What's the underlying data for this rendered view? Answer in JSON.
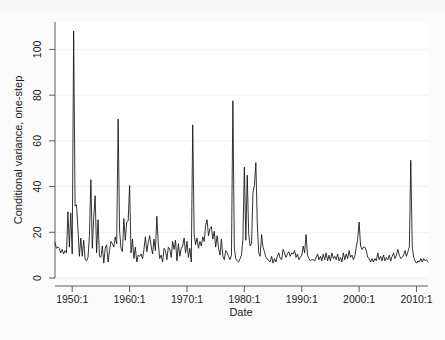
{
  "figure": {
    "background_color": "#fbfbfb",
    "plot_background_color": "#ffffff",
    "line_color": "#111111",
    "axis_color": "#4a4a4a",
    "grid_color": "#e8e8e8"
  },
  "chart_data": {
    "type": "line",
    "title": "",
    "subtitle": "",
    "xlabel": "Date",
    "ylabel": "Conditional variance, one-step",
    "xlim": [
      1947.0,
      2012.0
    ],
    "ylim": [
      0,
      112
    ],
    "yticks": [
      0,
      20,
      40,
      60,
      80,
      100
    ],
    "ytick_labels": [
      "0",
      "20",
      "40",
      "60",
      "80",
      "100"
    ],
    "xticks": [
      1950,
      1960,
      1970,
      1980,
      1990,
      2000,
      2010
    ],
    "xtick_labels": [
      "1950:1",
      "1960:1",
      "1970:1",
      "1980:1",
      "1990:1",
      "2000:1",
      "2010:1"
    ],
    "grid": true,
    "grid_axis": "y",
    "legend": false,
    "legend_position": "none",
    "series": [
      {
        "name": "Conditional variance, one-step",
        "color": "#111111",
        "x": [
          1947.0,
          1947.25,
          1947.5,
          1947.75,
          1948.0,
          1948.25,
          1948.5,
          1948.75,
          1949.0,
          1949.25,
          1949.5,
          1949.75,
          1950.0,
          1950.25,
          1950.5,
          1950.75,
          1951.0,
          1951.25,
          1951.5,
          1951.75,
          1952.0,
          1952.25,
          1952.5,
          1952.75,
          1953.0,
          1953.25,
          1953.5,
          1953.75,
          1954.0,
          1954.25,
          1954.5,
          1954.75,
          1955.0,
          1955.25,
          1955.5,
          1955.75,
          1956.0,
          1956.25,
          1956.5,
          1956.75,
          1957.0,
          1957.25,
          1957.5,
          1957.75,
          1958.0,
          1958.25,
          1958.5,
          1958.75,
          1959.0,
          1959.25,
          1959.5,
          1959.75,
          1960.0,
          1960.25,
          1960.5,
          1960.75,
          1961.0,
          1961.25,
          1961.5,
          1961.75,
          1962.0,
          1962.25,
          1962.5,
          1962.75,
          1963.0,
          1963.25,
          1963.5,
          1963.75,
          1964.0,
          1964.25,
          1964.5,
          1964.75,
          1965.0,
          1965.25,
          1965.5,
          1965.75,
          1966.0,
          1966.25,
          1966.5,
          1966.75,
          1967.0,
          1967.25,
          1967.5,
          1967.75,
          1968.0,
          1968.25,
          1968.5,
          1968.75,
          1969.0,
          1969.25,
          1969.5,
          1969.75,
          1970.0,
          1970.25,
          1970.5,
          1970.75,
          1971.0,
          1971.25,
          1971.5,
          1971.75,
          1972.0,
          1972.25,
          1972.5,
          1972.75,
          1973.0,
          1973.25,
          1973.5,
          1973.75,
          1974.0,
          1974.25,
          1974.5,
          1974.75,
          1975.0,
          1975.25,
          1975.5,
          1975.75,
          1976.0,
          1976.25,
          1976.5,
          1976.75,
          1977.0,
          1977.25,
          1977.5,
          1977.75,
          1978.0,
          1978.25,
          1978.5,
          1978.75,
          1979.0,
          1979.25,
          1979.5,
          1979.75,
          1980.0,
          1980.25,
          1980.5,
          1980.75,
          1981.0,
          1981.25,
          1981.5,
          1981.75,
          1982.0,
          1982.25,
          1982.5,
          1982.75,
          1983.0,
          1983.25,
          1983.5,
          1983.75,
          1984.0,
          1984.25,
          1984.5,
          1984.75,
          1985.0,
          1985.25,
          1985.5,
          1985.75,
          1986.0,
          1986.25,
          1986.5,
          1986.75,
          1987.0,
          1987.25,
          1987.5,
          1987.75,
          1988.0,
          1988.25,
          1988.5,
          1988.75,
          1989.0,
          1989.25,
          1989.5,
          1989.75,
          1990.0,
          1990.25,
          1990.5,
          1990.75,
          1991.0,
          1991.25,
          1991.5,
          1991.75,
          1992.0,
          1992.25,
          1992.5,
          1992.75,
          1993.0,
          1993.25,
          1993.5,
          1993.75,
          1994.0,
          1994.25,
          1994.5,
          1994.75,
          1995.0,
          1995.25,
          1995.5,
          1995.75,
          1996.0,
          1996.25,
          1996.5,
          1996.75,
          1997.0,
          1997.25,
          1997.5,
          1997.75,
          1998.0,
          1998.25,
          1998.5,
          1998.75,
          1999.0,
          1999.25,
          1999.5,
          1999.75,
          2000.0,
          2000.25,
          2000.5,
          2000.75,
          2001.0,
          2001.25,
          2001.5,
          2001.75,
          2002.0,
          2002.25,
          2002.5,
          2002.75,
          2003.0,
          2003.25,
          2003.5,
          2003.75,
          2004.0,
          2004.25,
          2004.5,
          2004.75,
          2005.0,
          2005.25,
          2005.5,
          2005.75,
          2006.0,
          2006.25,
          2006.5,
          2006.75,
          2007.0,
          2007.25,
          2007.5,
          2007.75,
          2008.0,
          2008.25,
          2008.5,
          2008.75,
          2009.0,
          2009.25,
          2009.5,
          2009.75,
          2010.0,
          2010.25,
          2010.5,
          2010.75,
          2011.0,
          2011.25,
          2011.5,
          2011.75,
          2012.0
        ],
        "values": [
          15.5,
          13.0,
          13.5,
          13.0,
          11.0,
          12.5,
          10.5,
          12.0,
          11.0,
          29.0,
          13.5,
          28.5,
          10.5,
          108.0,
          31.5,
          32.0,
          21.5,
          9.5,
          17.5,
          9.5,
          16.5,
          8.0,
          7.5,
          9.0,
          18.5,
          43.0,
          13.0,
          26.5,
          36.0,
          11.0,
          25.5,
          9.5,
          9.0,
          14.0,
          6.5,
          13.0,
          14.5,
          7.0,
          12.0,
          16.0,
          15.0,
          13.5,
          18.0,
          15.0,
          69.5,
          21.0,
          13.0,
          11.5,
          26.0,
          16.5,
          24.5,
          25.0,
          40.5,
          11.0,
          17.0,
          8.5,
          13.5,
          7.0,
          10.0,
          9.5,
          10.5,
          8.5,
          12.5,
          18.0,
          11.5,
          15.5,
          18.5,
          14.0,
          10.5,
          17.0,
          12.0,
          27.0,
          15.0,
          8.5,
          10.0,
          7.0,
          13.0,
          12.0,
          8.0,
          13.5,
          12.5,
          9.0,
          16.0,
          12.5,
          16.5,
          7.5,
          15.0,
          9.5,
          13.0,
          14.0,
          17.5,
          11.0,
          16.0,
          9.0,
          13.0,
          7.0,
          67.0,
          19.0,
          14.5,
          17.5,
          13.0,
          16.0,
          14.0,
          18.0,
          16.0,
          23.0,
          25.5,
          18.5,
          21.5,
          22.5,
          17.0,
          20.5,
          13.5,
          18.5,
          13.0,
          10.0,
          17.0,
          9.5,
          8.0,
          12.0,
          11.0,
          9.5,
          8.0,
          10.0,
          77.5,
          13.0,
          8.5,
          7.5,
          7.0,
          8.5,
          10.0,
          17.0,
          48.5,
          16.5,
          45.0,
          19.5,
          14.0,
          15.0,
          37.5,
          40.5,
          50.5,
          24.0,
          11.0,
          9.5,
          19.0,
          13.5,
          11.5,
          9.0,
          8.5,
          7.5,
          7.0,
          9.5,
          6.5,
          8.5,
          7.0,
          9.5,
          11.0,
          8.5,
          8.0,
          12.5,
          11.0,
          9.0,
          10.5,
          11.5,
          9.5,
          11.0,
          10.5,
          12.0,
          9.0,
          10.5,
          8.0,
          9.0,
          10.0,
          14.0,
          11.0,
          19.0,
          10.0,
          8.5,
          7.5,
          8.0,
          8.0,
          7.5,
          9.0,
          10.5,
          8.0,
          9.5,
          7.5,
          10.5,
          8.0,
          11.0,
          7.5,
          10.0,
          7.5,
          11.0,
          8.5,
          9.5,
          8.0,
          10.5,
          7.5,
          9.0,
          7.0,
          11.0,
          8.0,
          10.5,
          8.5,
          12.0,
          9.0,
          10.0,
          8.0,
          9.5,
          13.5,
          17.0,
          24.5,
          14.0,
          12.5,
          13.5,
          13.5,
          12.0,
          9.0,
          8.5,
          7.0,
          8.5,
          7.0,
          8.5,
          7.5,
          11.0,
          8.0,
          9.5,
          7.5,
          10.0,
          7.5,
          9.0,
          8.0,
          10.0,
          7.5,
          9.5,
          11.0,
          8.5,
          10.0,
          12.5,
          10.0,
          8.5,
          9.0,
          10.0,
          12.0,
          9.5,
          11.5,
          13.5,
          51.5,
          14.0,
          9.0,
          7.5,
          6.5,
          7.5,
          7.0,
          8.5,
          7.0,
          8.5,
          7.5,
          8.0,
          7.0
        ]
      }
    ]
  }
}
